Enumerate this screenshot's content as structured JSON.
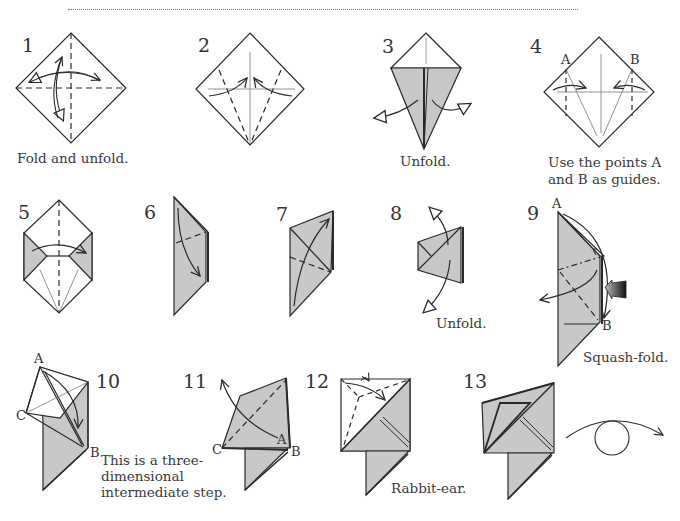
{
  "diagram": {
    "colors": {
      "paper_shade": "#c8c8c8",
      "line": "#2a2a2a",
      "background": "#ffffff",
      "arrow_push": "#333333"
    },
    "steps": [
      {
        "number": "1",
        "caption": "Fold and unfold.",
        "labels": []
      },
      {
        "number": "2",
        "caption": "",
        "labels": []
      },
      {
        "number": "3",
        "caption": "Unfold.",
        "labels": []
      },
      {
        "number": "4",
        "caption_lines": [
          "Use the points A",
          "and B as guides."
        ],
        "labels": [
          "A",
          "B"
        ]
      },
      {
        "number": "5",
        "caption": "",
        "labels": []
      },
      {
        "number": "6",
        "caption": "",
        "labels": []
      },
      {
        "number": "7",
        "caption": "",
        "labels": []
      },
      {
        "number": "8",
        "caption": "Unfold.",
        "labels": []
      },
      {
        "number": "9",
        "caption": "Squash-fold.",
        "labels": [
          "A",
          "B"
        ]
      },
      {
        "number": "10",
        "caption_lines": [
          "This is a three-",
          "dimensional",
          "intermediate step."
        ],
        "labels": [
          "A",
          "B",
          "C"
        ]
      },
      {
        "number": "11",
        "caption": "",
        "labels": [
          "A",
          "B",
          "C"
        ]
      },
      {
        "number": "12",
        "caption": "Rabbit-ear.",
        "labels": []
      },
      {
        "number": "13",
        "caption": "",
        "labels": []
      }
    ],
    "icons": {
      "turn_over": "turn-over-arrow-icon",
      "push": "push-arrow-icon"
    }
  }
}
